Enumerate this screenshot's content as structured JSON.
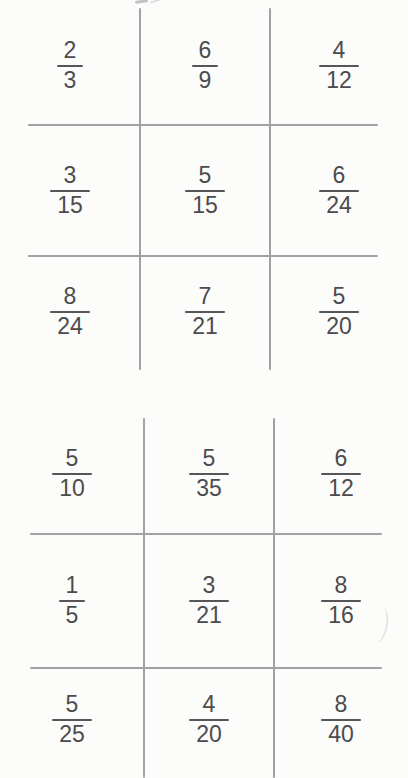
{
  "colors": {
    "background": "#fcfcfa",
    "grid_line": "#a2a2a2",
    "digit_text": "#4b4b4d",
    "fraction_bar": "#565658"
  },
  "boards": [
    {
      "cells": [
        {
          "num": "2",
          "den": "3"
        },
        {
          "num": "6",
          "den": "9"
        },
        {
          "num": "4",
          "den": "12"
        },
        {
          "num": "3",
          "den": "15"
        },
        {
          "num": "5",
          "den": "15"
        },
        {
          "num": "6",
          "den": "24"
        },
        {
          "num": "8",
          "den": "24"
        },
        {
          "num": "7",
          "den": "21"
        },
        {
          "num": "5",
          "den": "20"
        }
      ]
    },
    {
      "cells": [
        {
          "num": "5",
          "den": "10"
        },
        {
          "num": "5",
          "den": "35"
        },
        {
          "num": "6",
          "den": "12"
        },
        {
          "num": "1",
          "den": "5"
        },
        {
          "num": "3",
          "den": "21"
        },
        {
          "num": "8",
          "den": "16"
        },
        {
          "num": "5",
          "den": "25"
        },
        {
          "num": "4",
          "den": "20"
        },
        {
          "num": "8",
          "den": "40"
        }
      ]
    }
  ]
}
